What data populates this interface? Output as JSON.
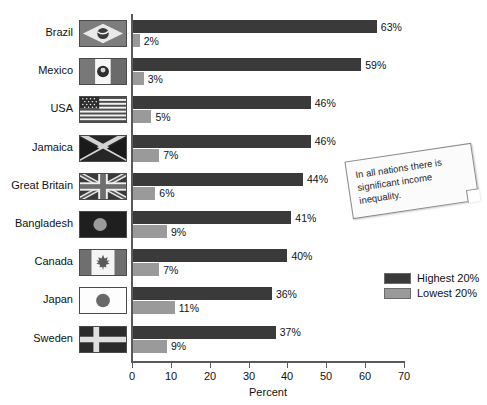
{
  "chart_data": {
    "type": "bar",
    "orientation": "horizontal",
    "title": "",
    "xlabel": "Percent",
    "ylabel": "",
    "xlim": [
      0,
      70
    ],
    "xticks": [
      0,
      10,
      20,
      30,
      40,
      50,
      60,
      70
    ],
    "grid": false,
    "legend_position": "right-middle",
    "categories": [
      "Brazil",
      "Mexico",
      "USA",
      "Jamaica",
      "Great Britain",
      "Bangladesh",
      "Canada",
      "Japan",
      "Sweden"
    ],
    "series": [
      {
        "name": "Highest 20%",
        "color": "#3a3a3a",
        "values": [
          63,
          59,
          46,
          46,
          44,
          41,
          40,
          36,
          37
        ],
        "labels": [
          "63%",
          "59%",
          "46%",
          "46%",
          "44%",
          "41%",
          "40%",
          "36%",
          "37%"
        ]
      },
      {
        "name": "Lowest 20%",
        "color": "#9a9a9a",
        "values": [
          2,
          3,
          5,
          7,
          6,
          9,
          7,
          11,
          9
        ],
        "labels": [
          "2%",
          "3%",
          "5%",
          "7%",
          "6%",
          "9%",
          "7%",
          "11%",
          "9%"
        ]
      }
    ],
    "annotations": [
      {
        "name": "callout-note",
        "text": "In all nations there is significant income inequality."
      }
    ]
  },
  "axis": {
    "x_title": "Percent",
    "tick_labels": [
      "0",
      "10",
      "20",
      "30",
      "40",
      "50",
      "60",
      "70"
    ]
  },
  "legend": {
    "items": [
      {
        "label": "Highest 20%",
        "color": "#3a3a3a"
      },
      {
        "label": "Lowest 20%",
        "color": "#9a9a9a"
      }
    ]
  },
  "rows": [
    {
      "country": "Brazil",
      "flag": "flag-brazil",
      "high": "63%",
      "low": "2%"
    },
    {
      "country": "Mexico",
      "flag": "flag-mexico",
      "high": "59%",
      "low": "3%"
    },
    {
      "country": "USA",
      "flag": "flag-usa",
      "high": "46%",
      "low": "5%"
    },
    {
      "country": "Jamaica",
      "flag": "flag-jamaica",
      "high": "46%",
      "low": "7%"
    },
    {
      "country": "Great Britain",
      "flag": "flag-great-britain",
      "high": "44%",
      "low": "6%"
    },
    {
      "country": "Bangladesh",
      "flag": "flag-bangladesh",
      "high": "41%",
      "low": "9%"
    },
    {
      "country": "Canada",
      "flag": "flag-canada",
      "high": "40%",
      "low": "7%"
    },
    {
      "country": "Japan",
      "flag": "flag-japan",
      "high": "36%",
      "low": "11%"
    },
    {
      "country": "Sweden",
      "flag": "flag-sweden",
      "high": "37%",
      "low": "9%"
    }
  ],
  "callout": {
    "text": "In all nations there is significant income inequality."
  }
}
